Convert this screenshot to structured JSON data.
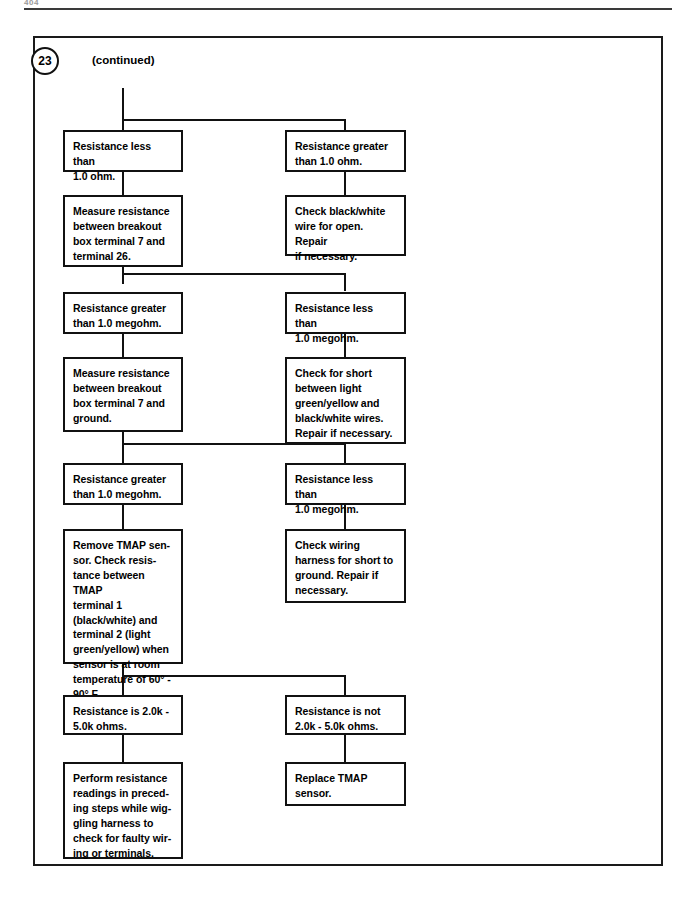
{
  "page": {
    "folio": "404",
    "step_number": "23",
    "continued_label": "(continued)"
  },
  "diagram": {
    "type": "flowchart",
    "columns": [
      "left",
      "right"
    ],
    "nodes": [
      {
        "id": "n1-left",
        "column": "left",
        "row": 1,
        "text": "Resistance less than\n1.0 ohm."
      },
      {
        "id": "n1-right",
        "column": "right",
        "row": 1,
        "text": "Resistance greater\nthan 1.0 ohm."
      },
      {
        "id": "n2-left",
        "column": "left",
        "row": 2,
        "text": "Measure resistance\nbetween breakout\nbox terminal 7 and\nterminal 26."
      },
      {
        "id": "n2-right",
        "column": "right",
        "row": 2,
        "text": "Check black/white\nwire for open. Repair\nif necessary."
      },
      {
        "id": "n3-left",
        "column": "left",
        "row": 3,
        "text": "Resistance greater\nthan 1.0 megohm."
      },
      {
        "id": "n3-right",
        "column": "right",
        "row": 3,
        "text": "Resistance less than\n1.0 megohm."
      },
      {
        "id": "n4-left",
        "column": "left",
        "row": 4,
        "text": "Measure resistance\nbetween breakout\nbox terminal 7 and\nground."
      },
      {
        "id": "n4-right",
        "column": "right",
        "row": 4,
        "text": "Check for short\nbetween light\ngreen/yellow and\nblack/white wires.\nRepair if necessary."
      },
      {
        "id": "n5-left",
        "column": "left",
        "row": 5,
        "text": "Resistance greater\nthan 1.0 megohm."
      },
      {
        "id": "n5-right",
        "column": "right",
        "row": 5,
        "text": "Resistance less than\n1.0 megohm."
      },
      {
        "id": "n6-left",
        "column": "left",
        "row": 6,
        "text": "Remove TMAP sen-\nsor. Check resis-\ntance between TMAP\nterminal 1\n(black/white)  and\nterminal 2 (light\ngreen/yellow) when\nsensor is at room\ntemperature of 60° -\n90° F."
      },
      {
        "id": "n6-right",
        "column": "right",
        "row": 6,
        "text": "Check wiring\nharness for short to\nground. Repair if\nnecessary."
      },
      {
        "id": "n7-left",
        "column": "left",
        "row": 7,
        "text": "Resistance is 2.0k -\n5.0k ohms."
      },
      {
        "id": "n7-right",
        "column": "right",
        "row": 7,
        "text": "Resistance is not\n2.0k - 5.0k ohms."
      },
      {
        "id": "n8-left",
        "column": "left",
        "row": 8,
        "text": "Perform resistance\nreadings in preced-\ning steps while wig-\ngling harness to\ncheck for faulty wir-\ning or terminals."
      },
      {
        "id": "n8-right",
        "column": "right",
        "row": 8,
        "text": "Replace TMAP\nsensor."
      }
    ],
    "colors": {
      "line": "#111111",
      "frame": "#1a1a1a",
      "background": "#ffffff",
      "text": "#000000"
    }
  }
}
